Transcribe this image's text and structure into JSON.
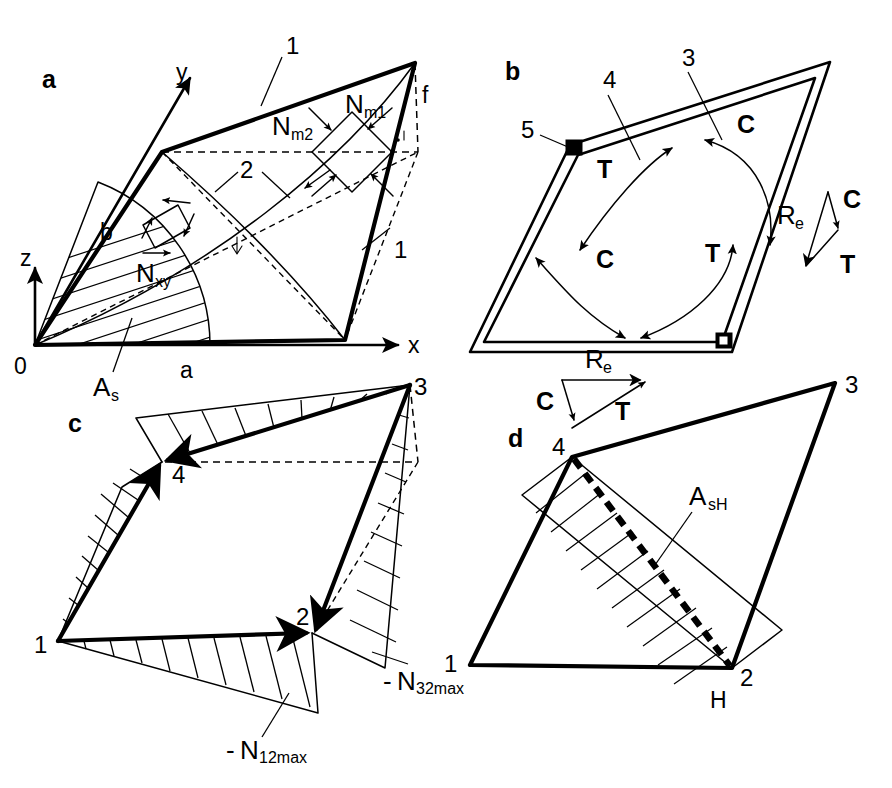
{
  "figure": {
    "panels": [
      {
        "id": "a",
        "letter": "a",
        "caption_labels": {
          "axis_x": "x",
          "axis_y": "y",
          "axis_z": "z",
          "origin": "0",
          "side_a": "a",
          "side_b": "b",
          "rise_f": "f"
        },
        "annotations": [
          {
            "name": "callout-1-top",
            "text": "1"
          },
          {
            "name": "callout-1-right",
            "text": "1"
          },
          {
            "name": "callout-2",
            "text": "2"
          },
          {
            "name": "membrane-force-1",
            "base": "N",
            "sub": "m1"
          },
          {
            "name": "membrane-force-2",
            "base": "N",
            "sub": "m2"
          },
          {
            "name": "shear-force-xy",
            "base": "N",
            "sub": "xy"
          },
          {
            "name": "reinforcement-area",
            "base": "A",
            "sub": "s"
          }
        ]
      },
      {
        "id": "b",
        "letter": "b",
        "annotations": [
          {
            "name": "callout-3",
            "text": "3"
          },
          {
            "name": "callout-4",
            "text": "4"
          },
          {
            "name": "callout-5",
            "text": "5"
          },
          {
            "name": "arc-label-c-top",
            "text": "C"
          },
          {
            "name": "arc-label-c-bottom",
            "text": "C"
          },
          {
            "name": "arc-label-t-top",
            "text": "T"
          },
          {
            "name": "arc-label-t-bottom",
            "text": "T"
          }
        ],
        "force_triangles": [
          {
            "name": "force-triangle-right",
            "vectors": [
              {
                "label_base": "R",
                "label_sub": "e",
                "name": "vector-resultant"
              },
              {
                "label_base": "C",
                "label_sub": "",
                "name": "vector-compression"
              },
              {
                "label_base": "T",
                "label_sub": "",
                "name": "vector-tension"
              }
            ]
          },
          {
            "name": "force-triangle-bottom",
            "vectors": [
              {
                "label_base": "R",
                "label_sub": "e",
                "name": "vector-resultant"
              },
              {
                "label_base": "C",
                "label_sub": "",
                "name": "vector-compression"
              },
              {
                "label_base": "T",
                "label_sub": "",
                "name": "vector-tension"
              }
            ]
          }
        ]
      },
      {
        "id": "c",
        "letter": "c",
        "corner_labels": [
          {
            "name": "corner-1",
            "text": "1"
          },
          {
            "name": "corner-2",
            "text": "2"
          },
          {
            "name": "corner-3",
            "text": "3"
          },
          {
            "name": "corner-4",
            "text": "4"
          }
        ],
        "annotations": [
          {
            "name": "force-n12max",
            "sign": "-",
            "base": "N",
            "sub": "12max"
          },
          {
            "name": "force-n32max",
            "sign": "-",
            "base": "N",
            "sub": "32max"
          }
        ]
      },
      {
        "id": "d",
        "letter": "d",
        "corner_labels": [
          {
            "name": "corner-1",
            "text": "1"
          },
          {
            "name": "corner-2",
            "text": "2"
          },
          {
            "name": "corner-3",
            "text": "3"
          },
          {
            "name": "corner-4",
            "text": "4"
          }
        ],
        "annotations": [
          {
            "name": "reinforcement-area-h",
            "base": "A",
            "sub": "sH"
          },
          {
            "name": "label-h",
            "text": "H"
          }
        ]
      }
    ],
    "colors": {
      "ink": "#000000",
      "paper": "#ffffff"
    }
  }
}
